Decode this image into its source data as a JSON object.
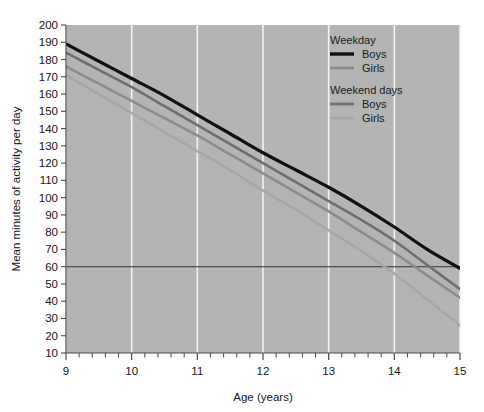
{
  "chart_data": {
    "type": "line",
    "title": "",
    "xlabel": "Age (years)",
    "ylabel": "Mean minutes of activity per day",
    "xlim": [
      9,
      15
    ],
    "ylim": [
      10,
      200
    ],
    "xticks": [
      9,
      10,
      11,
      12,
      13,
      14,
      15
    ],
    "xtick_labels": [
      "9",
      "10",
      "11",
      "12",
      "13",
      "14",
      "15"
    ],
    "yticks": [
      10,
      20,
      30,
      40,
      50,
      60,
      70,
      80,
      90,
      100,
      110,
      120,
      130,
      140,
      150,
      160,
      170,
      180,
      190,
      200
    ],
    "ytick_labels": [
      "10",
      "20",
      "30",
      "40",
      "50",
      "60",
      "70",
      "80",
      "90",
      "100",
      "110",
      "120",
      "130",
      "140",
      "150",
      "160",
      "170",
      "180",
      "190",
      "200"
    ],
    "x_minor_tick_step": 0.2,
    "grid": "vertical-white-gridlines-at-integer-ages",
    "plot_background": "#b4b4b4",
    "gridline_color": "#f2f2f2",
    "reference_line": {
      "label": "60 minutes per day guideline",
      "y": 60,
      "color": "#333333"
    },
    "x": [
      9,
      9.5,
      10,
      10.5,
      11,
      11.5,
      12,
      12.5,
      13,
      13.5,
      14,
      14.5,
      15
    ],
    "series": [
      {
        "name": "Weekday Boys",
        "group": "Weekday",
        "sex": "Boys",
        "color": "#111111",
        "width": 3.2,
        "values": [
          189,
          179,
          169,
          159,
          148,
          137,
          126,
          116,
          106,
          95,
          83,
          70,
          59
        ]
      },
      {
        "name": "Weekday Girls",
        "group": "Weekday",
        "sex": "Girls",
        "color": "#8c8c8c",
        "width": 2.6,
        "values": [
          176,
          166,
          156,
          146,
          136,
          125,
          114,
          103,
          92,
          80,
          68,
          55,
          42
        ]
      },
      {
        "name": "Weekend days Boys",
        "group": "Weekend days",
        "sex": "Boys",
        "color": "#6e6e6e",
        "width": 2.6,
        "values": [
          184,
          174,
          164,
          153,
          142,
          131,
          120,
          109,
          98,
          87,
          75,
          61,
          47
        ]
      },
      {
        "name": "Weekend days Girls",
        "group": "Weekend days",
        "sex": "Girls",
        "color": "#a8a8a8",
        "width": 2.6,
        "values": [
          171,
          160,
          149,
          138,
          127,
          116,
          104,
          93,
          81,
          69,
          56,
          41,
          26
        ]
      }
    ],
    "legend": {
      "position": "top-right-inside",
      "groups": [
        {
          "heading": "Weekday",
          "entries": [
            {
              "label": "Boys",
              "color": "#111111"
            },
            {
              "label": "Girls",
              "color": "#8c8c8c"
            }
          ]
        },
        {
          "heading": "Weekend days",
          "entries": [
            {
              "label": "Boys",
              "color": "#6e6e6e"
            },
            {
              "label": "Girls",
              "color": "#a8a8a8"
            }
          ]
        }
      ]
    }
  }
}
